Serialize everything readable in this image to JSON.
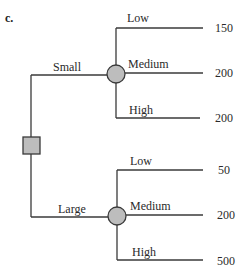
{
  "figure": {
    "part_label": "c.",
    "colors": {
      "line": "#3a3a3a",
      "node_fill": "#bdbdbd"
    },
    "decision_node": {
      "shape": "square-icon"
    },
    "decisions": [
      {
        "label": "Small",
        "chance_node": "circle-icon",
        "outcomes": [
          {
            "label": "Low",
            "value": "150"
          },
          {
            "label": "Medium",
            "value": "200"
          },
          {
            "label": "High",
            "value": "200"
          }
        ]
      },
      {
        "label": "Large",
        "chance_node": "circle-icon",
        "outcomes": [
          {
            "label": "Low",
            "value": "50"
          },
          {
            "label": "Medium",
            "value": "200"
          },
          {
            "label": "High",
            "value": "500"
          }
        ]
      }
    ]
  }
}
